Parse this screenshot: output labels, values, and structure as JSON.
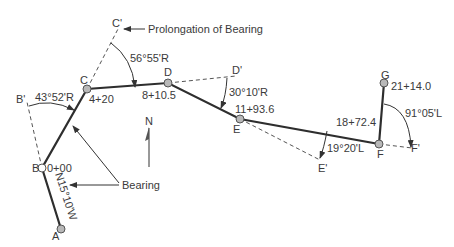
{
  "diagram": {
    "points": [
      {
        "id": "A",
        "label": "A",
        "station": ""
      },
      {
        "id": "B",
        "label": "B",
        "station": "0+00"
      },
      {
        "id": "C",
        "label": "C",
        "station": "4+20"
      },
      {
        "id": "D",
        "label": "D",
        "station": "8+10.5"
      },
      {
        "id": "E",
        "label": "E",
        "station": "11+93.6"
      },
      {
        "id": "F",
        "label": "F",
        "station": "18+72.4"
      },
      {
        "id": "G",
        "label": "G",
        "station": "21+14.0"
      }
    ],
    "prolongation_points": [
      "B'",
      "C'",
      "D'",
      "E'",
      "F'"
    ],
    "angles": {
      "B": "43°52'R",
      "C": "56°55'R",
      "D": "30°10'R",
      "E": "19°20'L",
      "F": "91°05'L"
    },
    "bearing_AB": "N15°10'W",
    "annotations": {
      "prolongation": "Prolongation of Bearing",
      "bearing": "Bearing",
      "north": "N"
    }
  }
}
